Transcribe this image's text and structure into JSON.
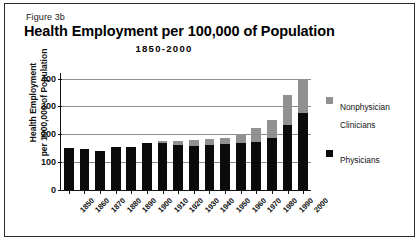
{
  "figure": {
    "number": "Figure 3b",
    "title": "Health Employment per 100,000 of Population",
    "subtitle": "1850-2000"
  },
  "legend": {
    "items": [
      {
        "label": "Nonphysician Clinicians",
        "color": "#919191",
        "swatch": "gray"
      },
      {
        "label": "Physicians",
        "color": "#0b0b0b",
        "swatch": "black"
      }
    ]
  },
  "axes": {
    "y_title_line1": "Health Employment",
    "y_title_line2": "per 1000,000 of Population",
    "y_ticks": [
      "0",
      "100",
      "200",
      "300",
      "400"
    ]
  },
  "chart_data": {
    "type": "bar",
    "subtype": "stacked",
    "title": "Health Employment per 100,000 of Population",
    "subtitle": "1850-2000",
    "xlabel": "",
    "ylabel": "Health Employment per 1000,000 of Population",
    "ylim": [
      0,
      420
    ],
    "yticks": [
      0,
      100,
      200,
      300,
      400
    ],
    "grid": true,
    "grid_axis": "y",
    "legend_position": "right",
    "categories": [
      "1850",
      "1860",
      "1870",
      "1880",
      "1890",
      "1900",
      "1910",
      "1920",
      "1930",
      "1940",
      "1950",
      "1960",
      "1970",
      "1980",
      "1990",
      "2000"
    ],
    "series": [
      {
        "name": "Physicians",
        "color": "#0b0b0b",
        "values": [
          150,
          148,
          141,
          155,
          156,
          170,
          168,
          160,
          158,
          160,
          165,
          168,
          172,
          185,
          232,
          275
        ]
      },
      {
        "name": "Nonphysician Clinicians",
        "color": "#919191",
        "values": [
          0,
          0,
          0,
          0,
          0,
          0,
          8,
          15,
          20,
          22,
          23,
          32,
          50,
          68,
          108,
          120
        ]
      }
    ],
    "totals": [
      150,
      148,
      141,
      155,
      156,
      170,
      176,
      175,
      178,
      182,
      188,
      200,
      222,
      253,
      340,
      395
    ]
  }
}
